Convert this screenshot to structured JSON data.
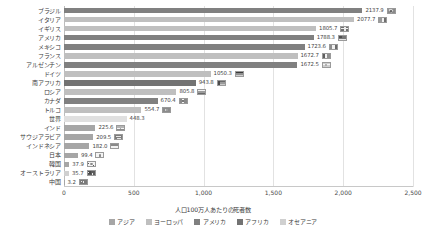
{
  "chart_data": {
    "type": "bar",
    "orientation": "horizontal",
    "title": "",
    "xlabel": "人口100万人あたりの死者数",
    "ylabel": "",
    "xlim": [
      0,
      2500
    ],
    "xticks": [
      "0",
      "500",
      "1,000",
      "1,500",
      "2,000",
      "2,500"
    ],
    "xtick_values": [
      0,
      500,
      1000,
      1500,
      2000,
      2500
    ],
    "grid": true,
    "legend_position": "bottom",
    "categories": [
      "ブラジル",
      "イタリア",
      "イギリス",
      "アメリカ",
      "メキシコ",
      "フランス",
      "アルゼンチン",
      "ドイツ",
      "南アフリカ",
      "ロシア",
      "カナダ",
      "トルコ",
      "世界",
      "インド",
      "サウジアラビア",
      "インドネシア",
      "日本",
      "韓国",
      "オーストラリア",
      "中国"
    ],
    "values": [
      2137.9,
      2077.7,
      1805.7,
      1788.3,
      1723.6,
      1672.7,
      1672.5,
      1050.3,
      943.8,
      805.8,
      670.4,
      554.7,
      448.3,
      225.6,
      209.5,
      182.0,
      99.4,
      37.9,
      35.7,
      3.2
    ],
    "value_labels": [
      "2137.9",
      "2077.7",
      "1805.7",
      "1788.3",
      "1723.6",
      "1672.7",
      "1672.5",
      "1050.3",
      "943.8",
      "805.8",
      "670.4",
      "554.7",
      "448.3",
      "225.6",
      "209.5",
      "182.0",
      "99.4",
      "37.9",
      "35.7",
      "3.2"
    ],
    "groups": [
      "アメリカ",
      "ヨーロッパ",
      "ヨーロッパ",
      "アメリカ",
      "アメリカ",
      "ヨーロッパ",
      "アメリカ",
      "ヨーロッパ",
      "アフリカ",
      "ヨーロッパ",
      "アメリカ",
      "ヨーロッパ",
      "世界",
      "アジア",
      "アジア",
      "アジア",
      "アジア",
      "アジア",
      "オセアニア",
      "アジア"
    ],
    "series": [
      {
        "name": "人口100万人あたりの死者数",
        "values": [
          2137.9,
          2077.7,
          1805.7,
          1788.3,
          1723.6,
          1672.7,
          1672.5,
          1050.3,
          943.8,
          805.8,
          670.4,
          554.7,
          448.3,
          225.6,
          209.5,
          182.0,
          99.4,
          37.9,
          35.7,
          3.2
        ]
      }
    ]
  },
  "legend": {
    "items": [
      {
        "label": "アジア",
        "color": "#a6a6a6"
      },
      {
        "label": "ヨーロッパ",
        "color": "#bfbfbf"
      },
      {
        "label": "アメリカ",
        "color": "#808080"
      },
      {
        "label": "アフリカ",
        "color": "#737373"
      },
      {
        "label": "オセアニア",
        "color": "#d0d0d0"
      }
    ]
  },
  "colors": {
    "asia": "#a6a6a6",
    "europe": "#bfbfbf",
    "america": "#808080",
    "africa": "#737373",
    "oceania": "#d0d0d0",
    "world": "#e0e0e0",
    "grid": "#e2e2e2",
    "text": "#3c3c3c"
  },
  "flags": {
    "ブラジル": "flag-brazil",
    "イタリア": "flag-italy",
    "イギリス": "flag-uk",
    "アメリカ": "flag-usa",
    "メキシコ": "flag-mexico",
    "フランス": "flag-france",
    "アルゼンチン": "flag-argentina",
    "ドイツ": "flag-germany",
    "南アフリカ": "flag-south-africa",
    "ロシア": "flag-russia",
    "カナダ": "flag-canada",
    "トルコ": "flag-turkey",
    "世界": "",
    "インド": "flag-india",
    "サウジアラビア": "flag-saudi-arabia",
    "インドネシア": "flag-indonesia",
    "日本": "flag-japan",
    "韓国": "flag-south-korea",
    "オーストラリア": "flag-australia",
    "中国": "flag-china"
  }
}
